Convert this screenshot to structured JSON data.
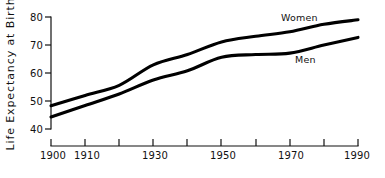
{
  "chart_data": {
    "type": "line",
    "title": "",
    "xlabel": "",
    "ylabel": "Life Expectancy at Birth",
    "xlim": [
      1900,
      1990
    ],
    "ylim": [
      40,
      80
    ],
    "grid": false,
    "legend": "inline-labels",
    "x_ticks": [
      1900,
      1910,
      1920,
      1930,
      1940,
      1950,
      1960,
      1970,
      1980,
      1990
    ],
    "x_tick_labels": [
      "1900",
      "1910",
      "",
      "1930",
      "",
      "1950",
      "",
      "1970",
      "",
      "1990"
    ],
    "y_ticks": [
      40,
      50,
      60,
      70,
      80
    ],
    "y_tick_labels": [
      "40",
      "50",
      "60",
      "70",
      "80"
    ],
    "x": [
      1900,
      1910,
      1920,
      1930,
      1940,
      1950,
      1960,
      1970,
      1980,
      1990
    ],
    "series": [
      {
        "name": "Women",
        "label": "Women",
        "color": "#000000",
        "values": [
          48.3,
          52.0,
          55.6,
          62.9,
          66.6,
          71.1,
          73.1,
          74.7,
          77.4,
          79.0
        ]
      },
      {
        "name": "Men",
        "label": "Men",
        "color": "#000000",
        "values": [
          44.3,
          48.4,
          52.5,
          57.5,
          60.8,
          65.6,
          66.6,
          67.1,
          70.0,
          72.7
        ]
      }
    ],
    "annotations": [
      {
        "text": "Women",
        "x": 1967,
        "y": 81.5
      },
      {
        "text": "Men",
        "x": 1973,
        "y": 69.0
      }
    ]
  }
}
